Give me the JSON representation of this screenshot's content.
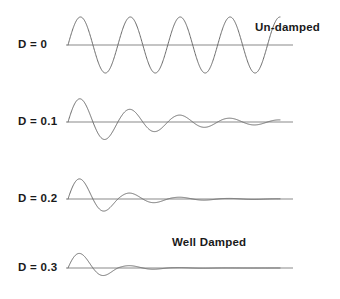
{
  "figure": {
    "background_color": "#ffffff",
    "line_color": "#6b6b6b",
    "axis_color": "#8a8a8a",
    "text_color": "#1a1a1a"
  },
  "rows": [
    {
      "label": "D = 0",
      "damping": 0,
      "annotation": "Un-damped",
      "baseline_y": 45,
      "label_x": 18,
      "label_y": 45,
      "annotation_x": 255,
      "annotation_y": 28
    },
    {
      "label": "D = 0.1",
      "damping": 0.1,
      "annotation": "",
      "baseline_y": 122,
      "label_x": 18,
      "label_y": 122,
      "annotation_x": 0,
      "annotation_y": 0
    },
    {
      "label": "D = 0.2",
      "damping": 0.2,
      "annotation": "",
      "baseline_y": 199,
      "label_x": 18,
      "label_y": 199,
      "annotation_x": 0,
      "annotation_y": 0
    },
    {
      "label": "D = 0.3",
      "damping": 0.3,
      "annotation": "Well Damped",
      "baseline_y": 268,
      "label_x": 18,
      "label_y": 268,
      "annotation_x": 172,
      "annotation_y": 243
    }
  ],
  "chart_data": {
    "type": "line",
    "xlabel": "",
    "ylabel": "",
    "grid": false,
    "legend_position": "inline-right",
    "x_start_px": 68,
    "x_end_px": 280,
    "baseline_start_px": 66,
    "baseline_end_px": 293,
    "cycles_visible": 4.25,
    "amplitude_px": 28,
    "series": [
      {
        "name": "D = 0",
        "damping_ratio": 0,
        "annotation": "Un-damped",
        "amplitude_px": 28,
        "cycles": 4.25,
        "envelope": [
          1.0,
          1.0,
          1.0,
          1.0,
          1.0
        ],
        "description": "Pure sinusoid, constant amplitude, four and a quarter cycles"
      },
      {
        "name": "D = 0.1",
        "damping_ratio": 0.1,
        "annotation": "",
        "amplitude_px": 26,
        "cycles": 4.25,
        "envelope": [
          1.0,
          0.53,
          0.28,
          0.15,
          0.08
        ],
        "description": "Underdamped, amplitude decays exponentially over about five cycles"
      },
      {
        "name": "D = 0.2",
        "damping_ratio": 0.2,
        "annotation": "",
        "amplitude_px": 24,
        "cycles": 4.25,
        "envelope": [
          1.0,
          0.28,
          0.08,
          0.025,
          0.008
        ],
        "description": "More strongly underdamped, settles after about three cycles"
      },
      {
        "name": "D = 0.3",
        "damping_ratio": 0.3,
        "annotation": "Well Damped",
        "amplitude_px": 18,
        "cycles": 4.25,
        "envelope": [
          1.0,
          0.15,
          0.022,
          0.003,
          0.0005
        ],
        "description": "Well damped, only about two visible cycles before flatlining"
      }
    ]
  }
}
